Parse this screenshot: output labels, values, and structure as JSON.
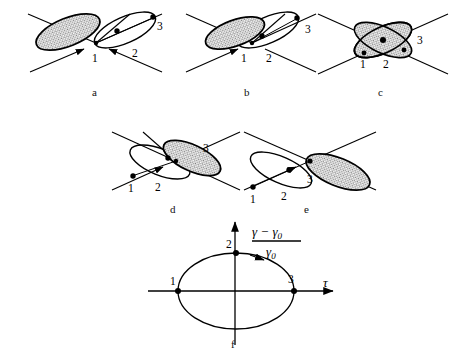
{
  "figure": {
    "background_color": "#ffffff",
    "line_color": "#000000",
    "hatch_color": "#8a8a8a",
    "panels": [
      {
        "id": "a",
        "caption": "a",
        "center": [
          96,
          42
        ],
        "shaded_side": "left",
        "point_labels": [
          "1",
          "2",
          "3"
        ],
        "description": "left lobe shaded, right lobe open"
      },
      {
        "id": "b",
        "caption": "b",
        "center": [
          247,
          42
        ],
        "shaded_side": "left",
        "point_labels": [
          "1",
          "2",
          "3"
        ],
        "description": "two lobes partially overlapping"
      },
      {
        "id": "c",
        "caption": "c",
        "center": [
          380,
          42
        ],
        "shaded_side": "both",
        "point_labels": [
          "1",
          "2",
          "3"
        ],
        "description": "maximum overlap, crossed ellipses"
      },
      {
        "id": "d",
        "caption": "d",
        "center": [
          175,
          160
        ],
        "shaded_side": "right",
        "point_labels": [
          "1",
          "2",
          "3"
        ],
        "description": "two lobes partially overlapping, mirror of b"
      },
      {
        "id": "e",
        "caption": "e",
        "center": [
          308,
          160
        ],
        "shaded_side": "right",
        "point_labels": [
          "1",
          "2",
          "3"
        ],
        "description": "right lobe shaded, left lobe open, mirror of a"
      }
    ],
    "plot": {
      "caption": "f",
      "x_axis_label": "τ",
      "y_axis_numerator": "γ − γ",
      "y_axis_numerator_sub": "0",
      "y_axis_denominator": "γ",
      "y_axis_denominator_sub": "0",
      "marked_points": [
        {
          "label": "1",
          "position": "left"
        },
        {
          "label": "2",
          "position": "top"
        },
        {
          "label": "3",
          "position": "right"
        }
      ],
      "direction": "clockwise"
    }
  }
}
